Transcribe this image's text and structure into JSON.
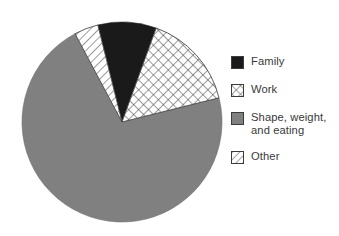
{
  "chart_data": {
    "type": "pie",
    "title": "",
    "subtitle": "",
    "categories": [
      "Family",
      "Work",
      "Shape, weight,\nand eating",
      "Other"
    ],
    "values": [
      9.5,
      15.5,
      71.0,
      4.0
    ],
    "units": "percent",
    "start_angle_deg": -14,
    "direction": "clockwise",
    "slices": [
      {
        "label": "Family",
        "value": 9.5,
        "start_deg": 0,
        "end_deg": 34,
        "fill": "solid",
        "color": "#1a1a1a"
      },
      {
        "label": "Work",
        "value": 15.5,
        "start_deg": 34,
        "end_deg": 90,
        "fill": "crosshatch",
        "color": "#ffffff"
      },
      {
        "label": "Shape, weight,\nand eating",
        "value": 71.0,
        "start_deg": 90,
        "end_deg": 346,
        "fill": "solid",
        "color": "#808080"
      },
      {
        "label": "Other",
        "value": 4.0,
        "start_deg": 346,
        "end_deg": 360,
        "fill": "diagonal",
        "color": "#ffffff"
      }
    ],
    "legend_position": "right",
    "grid": false,
    "xlabel": "",
    "ylabel": ""
  },
  "legend": {
    "items": [
      {
        "label": "Family",
        "swatch": "solid-black-swatch"
      },
      {
        "label": "Work",
        "swatch": "crosshatch-swatch"
      },
      {
        "label": "Shape, weight,\nand eating",
        "swatch": "solid-gray-swatch"
      },
      {
        "label": "Other",
        "swatch": "diagonal-hatch-swatch"
      }
    ]
  },
  "colors": {
    "black": "#1a1a1a",
    "gray": "#808080",
    "white": "#ffffff",
    "outline": "#3b3b3b",
    "text": "#39393a",
    "background": "#ffffff"
  }
}
